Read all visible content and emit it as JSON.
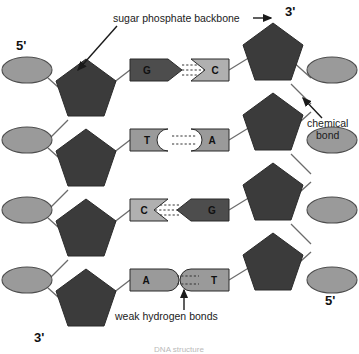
{
  "figure": {
    "caption": "DNA structure",
    "colors": {
      "sugar_dark": "#3b3b3b",
      "phosphate_gray": "#9a9a9a",
      "base_dark": "#4d4d4d",
      "base_light": "#b0b0b0",
      "base_mid": "#9a9a9a",
      "stroke": "#555555",
      "text": "#1a1a1a",
      "background": "#ffffff"
    }
  },
  "annotations": {
    "backbone": {
      "label": "sugar phosphate backbone",
      "arrow": "arrow-right"
    },
    "chemical_bond": {
      "label_line1": "chemical",
      "label_line2": "bond",
      "arrow": "arrow-up-left"
    },
    "hydrogen_bonds": {
      "label": "weak hydrogen bonds",
      "arrow": "arrow-up"
    }
  },
  "ends": {
    "top_left": "5'",
    "top_right": "3'",
    "bottom_left": "3'",
    "bottom_right": "5'"
  },
  "base_pairs": [
    {
      "row": 1,
      "left": {
        "base": "G",
        "shade": "dark",
        "edge": "point"
      },
      "right": {
        "base": "C",
        "shade": "light",
        "edge": "notch"
      },
      "hydrogen_bonds": 3
    },
    {
      "row": 2,
      "left": {
        "base": "T",
        "shade": "mid",
        "edge": "concave"
      },
      "right": {
        "base": "A",
        "shade": "mid",
        "edge": "convex"
      },
      "hydrogen_bonds": 2
    },
    {
      "row": 3,
      "left": {
        "base": "C",
        "shade": "light",
        "edge": "notch"
      },
      "right": {
        "base": "G",
        "shade": "dark",
        "edge": "point"
      },
      "hydrogen_bonds": 3
    },
    {
      "row": 4,
      "left": {
        "base": "A",
        "shade": "mid",
        "edge": "convex"
      },
      "right": {
        "base": "T",
        "shade": "mid",
        "edge": "concave"
      },
      "hydrogen_bonds": 2
    }
  ],
  "structure": {
    "sugar_name": "deoxyribose-sugar",
    "phosphate_name": "phosphate-group",
    "strand_left": "strand-left",
    "strand_right": "strand-right"
  }
}
